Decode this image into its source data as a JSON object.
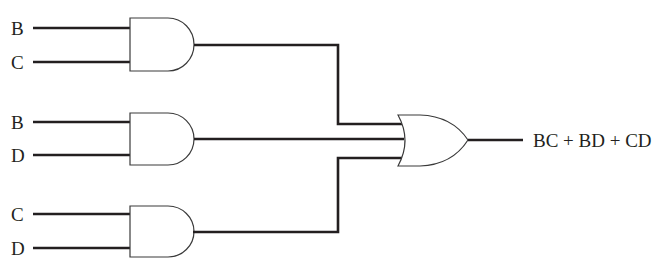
{
  "diagram": {
    "type": "logic-circuit",
    "inputs": [
      {
        "gate": "and-1",
        "labels": [
          "B",
          "C"
        ]
      },
      {
        "gate": "and-2",
        "labels": [
          "B",
          "D"
        ]
      },
      {
        "gate": "and-3",
        "labels": [
          "C",
          "D"
        ]
      }
    ],
    "gates": [
      {
        "id": "and-1",
        "type": "AND",
        "inputs": [
          "B",
          "C"
        ],
        "output": "BC"
      },
      {
        "id": "and-2",
        "type": "AND",
        "inputs": [
          "B",
          "D"
        ],
        "output": "BD"
      },
      {
        "id": "and-3",
        "type": "AND",
        "inputs": [
          "C",
          "D"
        ],
        "output": "CD"
      },
      {
        "id": "or-1",
        "type": "OR",
        "inputs": [
          "BC",
          "BD",
          "CD"
        ],
        "output": "BC + BD + CD"
      }
    ],
    "output_label": "BC + BD + CD",
    "colors": {
      "line": "#231f20",
      "gate_fill": "#ffffff",
      "background": "#ffffff"
    }
  }
}
